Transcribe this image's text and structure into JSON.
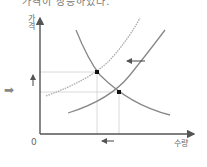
{
  "header": {
    "partial_text": "가격이 상승하였다."
  },
  "diagram": {
    "title": "",
    "y_axis_label": "가격",
    "x_axis_label": "수량",
    "origin_label": "0",
    "lead_arrow_icon": "➡",
    "curves": [
      {
        "name": "demand",
        "style": "solid",
        "direction": "downward-sloping"
      },
      {
        "name": "supply-original",
        "style": "solid",
        "direction": "upward-sloping"
      },
      {
        "name": "supply-shifted",
        "style": "dotted",
        "direction": "upward-sloping",
        "shift": "left"
      }
    ],
    "equilibria": [
      {
        "name": "new-equilibrium",
        "relative_price": "higher",
        "relative_quantity": "lower"
      },
      {
        "name": "original-equilibrium",
        "relative_price": "lower",
        "relative_quantity": "higher"
      }
    ],
    "annotations": {
      "supply_shift_arrow": "left",
      "price_change_arrow": "up",
      "quantity_change_arrow": "left"
    },
    "colors": {
      "axis": "#555555",
      "curve": "#888888",
      "dotted_curve": "#aaaaaa",
      "guide": "#cccccc",
      "point": "#111111"
    }
  }
}
